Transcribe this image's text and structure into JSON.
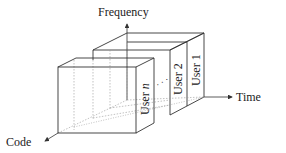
{
  "diagram": {
    "axes": {
      "frequency_label": "Frequency",
      "time_label": "Time",
      "code_label": "Code"
    },
    "users": [
      {
        "label": "User 1"
      },
      {
        "label": "User 2"
      },
      {
        "label_prefix": "User ",
        "label_var": "n"
      }
    ],
    "ellipsis": "· · ·",
    "colors": {
      "line": "#333333",
      "dotted": "#999999",
      "text": "#222222",
      "background": "#ffffff"
    }
  }
}
